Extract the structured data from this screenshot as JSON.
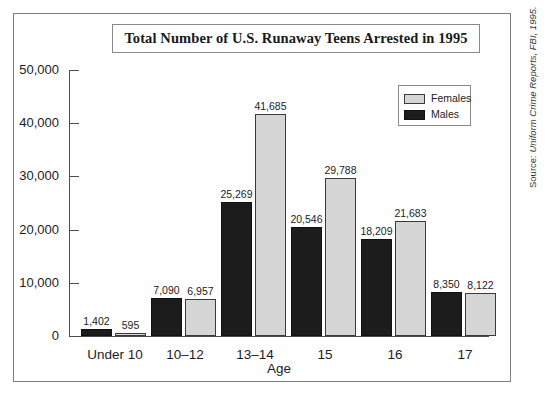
{
  "chart_data": {
    "type": "bar",
    "title": "Total Number of U.S. Runaway Teens Arrested in 1995",
    "xlabel": "Age",
    "ylabel": "",
    "categories": [
      "Under 10",
      "10–12",
      "13–14",
      "15",
      "16",
      "17"
    ],
    "series": [
      {
        "name": "Males",
        "color": "#1c1c1c",
        "values": [
          1402,
          7090,
          25269,
          20546,
          18209,
          8350
        ],
        "labels": [
          "1,402",
          "7,090",
          "25,269",
          "20,546",
          "18,209",
          "8,350"
        ]
      },
      {
        "name": "Females",
        "color": "#d6d6d6",
        "values": [
          595,
          6957,
          41685,
          29788,
          21683,
          8122
        ],
        "labels": [
          "595",
          "6,957",
          "41,685",
          "29,788",
          "21,683",
          "8,122"
        ]
      }
    ],
    "ylim": [
      0,
      50000
    ],
    "yticks": [
      0,
      10000,
      20000,
      30000,
      40000,
      50000
    ],
    "ytick_labels": [
      "0",
      "10,000",
      "20,000",
      "30,000",
      "40,000",
      "50,000"
    ],
    "grid": false,
    "legend_position": "top-right",
    "legend_entries": [
      "Females",
      "Males"
    ]
  },
  "source": {
    "prefix": "Source: ",
    "text": "Uniform Crime Reports, FBI, 1995."
  }
}
